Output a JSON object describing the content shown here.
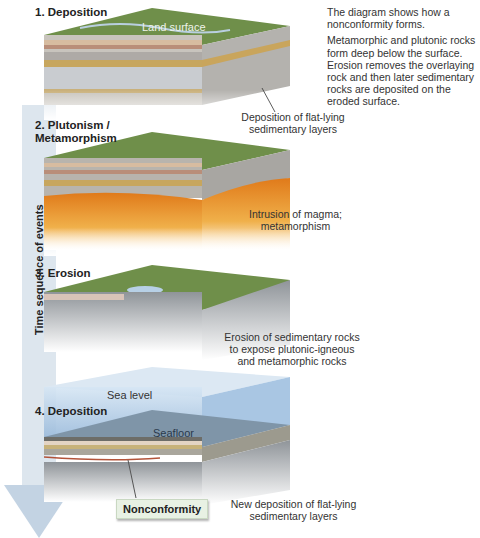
{
  "intro": {
    "line1": "The diagram shows how a nonconformity forms.",
    "line2": "Metamorphic and plutonic rocks form deep below the surface. Erosion removes the overlaying rock and then later sedimentary rocks are deposited on the eroded surface."
  },
  "axis": {
    "label": "Time sequence of events"
  },
  "steps": [
    {
      "title": "1. Deposition",
      "surface_label": "Land surface",
      "caption": "Deposition of flat-lying sedimentary layers"
    },
    {
      "title": "2. Plutonism / Metamorphism",
      "caption": "Intrusion of magma; metamorphism"
    },
    {
      "title": "3. Erosion",
      "caption": "Erosion of sedimentary rocks to expose plutonic-igneous and metamorphic rocks"
    },
    {
      "title": "4. Deposition",
      "sea_label": "Sea level",
      "floor_label": "Seafloor",
      "caption": "New deposition of flat-lying sedimentary layers",
      "badge": "Nonconformity"
    }
  ],
  "colors": {
    "grass": "#6f8f4a",
    "magma": "#e8962e",
    "water": "#a9c6e3",
    "arrow": "#c3d3e3",
    "badge_bg": "#e8f1e4"
  }
}
